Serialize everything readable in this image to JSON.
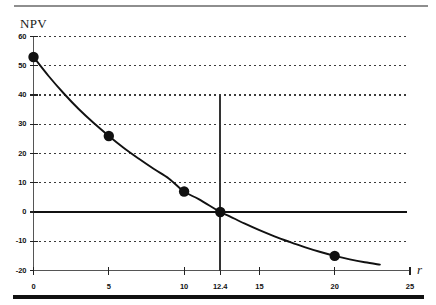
{
  "chart_data": {
    "type": "line",
    "title": "",
    "xlabel": "r",
    "ylabel": "NPV",
    "xlim": [
      0,
      25
    ],
    "ylim": [
      -20,
      60
    ],
    "grid": true,
    "legend": null,
    "x_ticks": [
      "0",
      "5",
      "10",
      "12.4",
      "15",
      "20",
      "25"
    ],
    "x_tick_values": [
      0,
      5,
      10,
      12.4,
      15,
      20,
      25
    ],
    "y_ticks": [
      "60",
      "50",
      "40",
      "30",
      "20",
      "10",
      "0",
      "-10",
      "-20"
    ],
    "y_tick_values": [
      60,
      50,
      40,
      30,
      20,
      10,
      0,
      -10,
      -20
    ],
    "series": [
      {
        "name": "NPV",
        "x": [
          0,
          5,
          10,
          12.4,
          20
        ],
        "values": [
          53,
          26,
          7,
          0,
          -15
        ],
        "marker": "filled-circle",
        "color": "#111111"
      }
    ],
    "curve_points": [
      [
        0,
        53
      ],
      [
        1,
        46.5
      ],
      [
        2,
        40.6
      ],
      [
        3,
        35.2
      ],
      [
        4,
        30.4
      ],
      [
        5,
        26
      ],
      [
        6,
        21.9
      ],
      [
        7,
        18.2
      ],
      [
        8,
        14.7
      ],
      [
        9,
        11.4
      ],
      [
        10,
        7
      ],
      [
        11,
        4.3
      ],
      [
        12.4,
        0
      ],
      [
        13,
        -1.4
      ],
      [
        14,
        -3.9
      ],
      [
        15,
        -6.2
      ],
      [
        16,
        -8.3
      ],
      [
        17,
        -10.2
      ],
      [
        18,
        -12
      ],
      [
        19,
        -13.6
      ],
      [
        20,
        -15
      ],
      [
        21,
        -16.2
      ],
      [
        22,
        -17.2
      ],
      [
        23,
        -18
      ]
    ],
    "annotations": [
      {
        "name": "irr-vertical-line",
        "x": 12.4,
        "y_from": 40,
        "y_to": -20
      },
      {
        "name": "zero-axis-line",
        "y": 0
      }
    ]
  },
  "axes": {
    "y_title": "NPV",
    "x_title": "r"
  },
  "colors": {
    "curve": "#111111",
    "marker": "#111111",
    "grid": "#3a3a3a",
    "axis": "#555555",
    "zero_axis": "#111111",
    "rule_top": "#8e8e8e",
    "rule_bottom": "#111111",
    "background": "#ffffff"
  }
}
